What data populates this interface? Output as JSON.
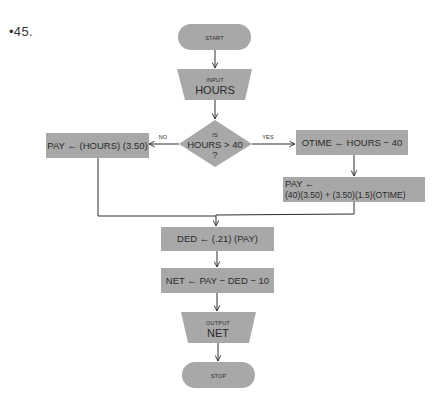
{
  "problem_number": "•45.",
  "colors": {
    "shape_fill": "#a8a8a8",
    "line": "#2e2e2e",
    "text": "#2a2a2a",
    "background": "#ffffff"
  },
  "flowchart": {
    "start": {
      "type": "terminal",
      "label": "START"
    },
    "input": {
      "type": "input-output",
      "label_small": "INPUT",
      "label_big": "HOURS"
    },
    "decision": {
      "type": "decision",
      "line1": "IS",
      "line2": "HOURS > 40",
      "line3": "?"
    },
    "branch_no": {
      "edge_label": "NO",
      "type": "process",
      "label": "PAY ← (HOURS) (3.50)"
    },
    "branch_yes": {
      "edge_label": "YES",
      "type": "process",
      "label": "OTIME ← HOURS − 40"
    },
    "overtime_pay": {
      "type": "process",
      "line1": "PAY ←",
      "line2": "(40)(3.50) + (3.50)(1.5)(OTIME)"
    },
    "deduction": {
      "type": "process",
      "label": "DED ← (.21) (PAY)"
    },
    "net": {
      "type": "process",
      "label": "NET ← PAY − DED − 10"
    },
    "output": {
      "type": "input-output",
      "label_small": "OUTPUT",
      "label_big": "NET"
    },
    "stop": {
      "type": "terminal",
      "label": "STOP"
    }
  }
}
